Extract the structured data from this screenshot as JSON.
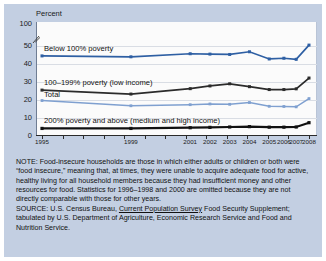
{
  "chart_data": {
    "type": "line",
    "title": "",
    "xlabel": "",
    "ylabel": "Percent",
    "ylim": [
      0,
      100
    ],
    "y_ticks": [
      "100",
      "50",
      "40",
      "30",
      "20",
      "10",
      "0"
    ],
    "y_axis_break": true,
    "grid": true,
    "legend_position": "inline-labels",
    "categories": [
      "1995",
      "1999",
      "2001",
      "2002",
      "2003",
      "2004",
      "2005",
      "2006",
      "2007",
      "2008"
    ],
    "series": [
      {
        "name": "Below 100% poverty",
        "color": "#2e5fa3",
        "values": [
          44.5,
          44.0,
          45.7,
          45.5,
          45.3,
          46.8,
          42.8,
          43.2,
          42.6,
          50.5
        ]
      },
      {
        "name": "100–199% poverty (low income)",
        "color": "#2b2b2b",
        "values": [
          25.5,
          23.3,
          26.3,
          27.8,
          29.0,
          27.4,
          25.8,
          25.8,
          26.2,
          32.2
        ]
      },
      {
        "name": "Total",
        "color": "#7fa0d0",
        "values": [
          19.7,
          16.8,
          17.4,
          17.8,
          17.6,
          18.6,
          16.5,
          16.4,
          16.2,
          20.8
        ]
      },
      {
        "name": "200% poverty and above (medium and high income)",
        "color": "#111111",
        "values": [
          4.2,
          4.2,
          4.6,
          4.8,
          5.0,
          5.2,
          4.9,
          4.9,
          5.0,
          7.4
        ]
      }
    ]
  },
  "axis": {
    "y_title": "Percent",
    "y_ticks": [
      "100",
      "50",
      "40",
      "30",
      "20",
      "10",
      "0"
    ],
    "x_ticks": [
      "1995",
      "1999",
      "2001",
      "2002",
      "2003",
      "2004",
      "2005",
      "2006",
      "2007",
      "2008"
    ]
  },
  "series_labels": {
    "s0": "Below 100% poverty",
    "s1": "100–199% poverty (low income)",
    "s2": "Total",
    "s3": "200% poverty and above (medium and high income)"
  },
  "notes": {
    "note_text": "NOTE: Food-insecure households are those in which either adults or children or both were “food insecure,” meaning that, at times, they were unable to acquire adequate food for active, healthy living for all household members because they had insufficient money and other resources for food. Statistics for 1996–1998 and 2000 are omitted because they are not directly comparable with those for other years.",
    "source_prefix": "SOURCE: U.S. Census Bureau, ",
    "source_italic": "Current Population Survey",
    "source_suffix": " Food Security Supplement; tabulated by U.S. Department of Agriculture, Economic Research Service and Food and Nutrition Service."
  },
  "colors": {
    "panel": "#c3cfe2",
    "plot_bg": "#fbfbfb",
    "series_blue": "#2e5fa3",
    "series_dark": "#2b2b2b",
    "series_lightblue": "#7fa0d0",
    "series_black": "#111111"
  }
}
